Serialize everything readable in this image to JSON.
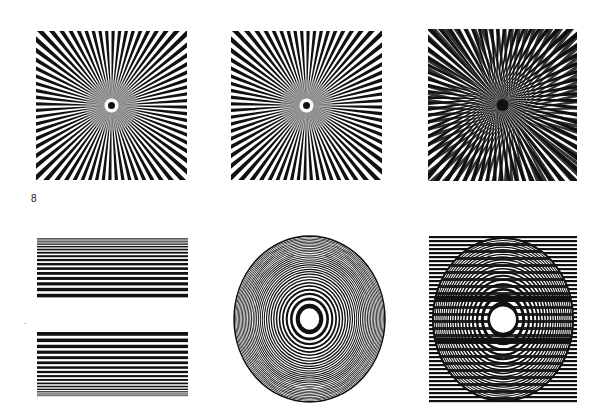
{
  "page": {
    "figure_number": "8",
    "background": "#ffffff",
    "ink": "#111111"
  },
  "panels": [
    {
      "id": "siemens-star-left",
      "type": "radial-star",
      "spokes": 72,
      "x": 36,
      "y": 31,
      "w": 151,
      "h": 149
    },
    {
      "id": "siemens-star-middle",
      "type": "radial-star",
      "spokes": 72,
      "x": 231,
      "y": 31,
      "w": 151,
      "h": 149
    },
    {
      "id": "moire-star-overlay",
      "type": "moire-star",
      "spokes": 72,
      "offset": 6,
      "x": 428,
      "y": 29,
      "w": 149,
      "h": 152
    },
    {
      "id": "line-grating-top",
      "type": "line-grating",
      "x": 37,
      "y": 238,
      "w": 151,
      "h": 62,
      "order": "fine-to-coarse"
    },
    {
      "id": "line-grating-bottom",
      "type": "line-grating",
      "x": 37,
      "y": 332,
      "w": 151,
      "h": 65,
      "order": "coarse-to-fine"
    },
    {
      "id": "zone-plate",
      "type": "concentric-rings",
      "x": 233,
      "y": 235,
      "w": 153,
      "h": 168
    },
    {
      "id": "zone-plate-with-gratings",
      "type": "zone-plate-moire",
      "x": 429,
      "y": 236,
      "w": 148,
      "h": 167
    }
  ]
}
